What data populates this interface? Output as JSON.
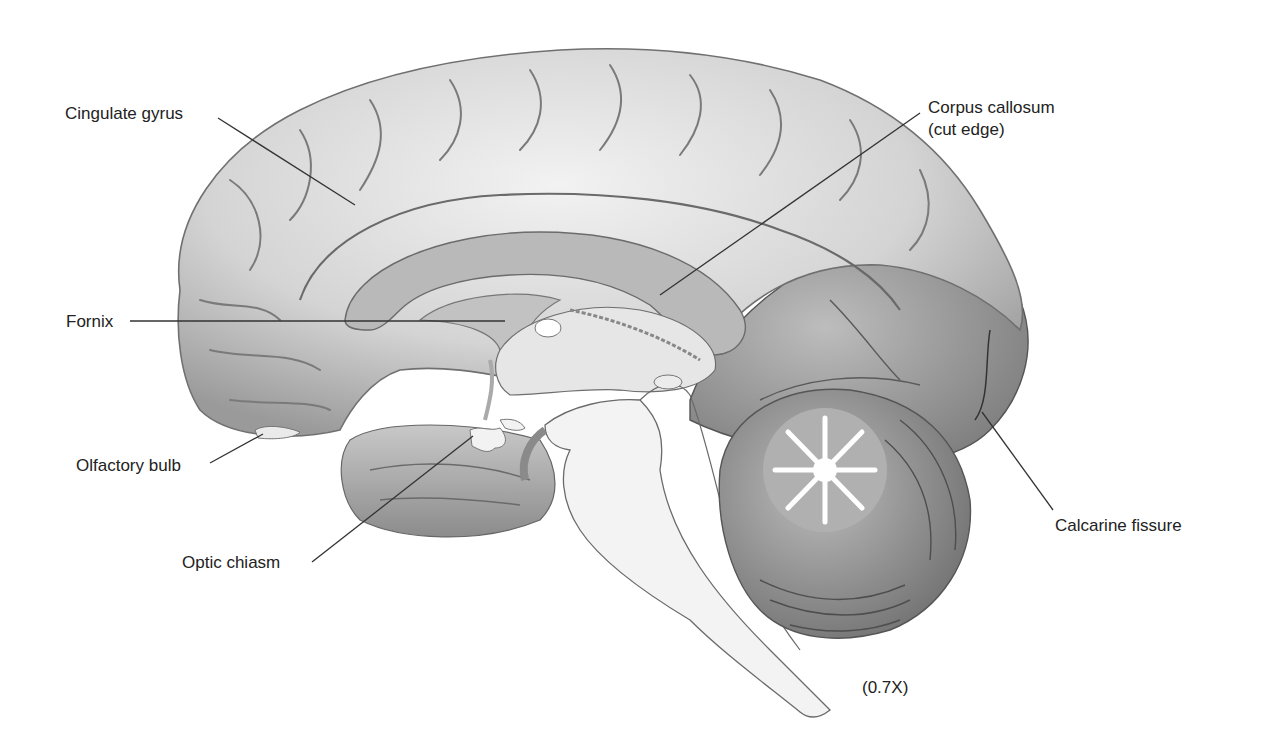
{
  "figure": {
    "magnification": "(0.7X)",
    "labels": [
      {
        "id": "cingulate-gyrus",
        "text": "Cingulate gyrus"
      },
      {
        "id": "corpus-callosum",
        "text": "Corpus callosum",
        "text2": "(cut edge)"
      },
      {
        "id": "fornix",
        "text": "Fornix"
      },
      {
        "id": "olfactory-bulb",
        "text": "Olfactory bulb"
      },
      {
        "id": "optic-chiasm",
        "text": "Optic chiasm"
      },
      {
        "id": "calcarine-fissure",
        "text": "Calcarine fissure"
      }
    ],
    "colors": {
      "background": "#ffffff",
      "cortex": "#d9d9d9",
      "cortex_shadow": "#8a8a8a",
      "cut_surface": "#b9b9b9",
      "white_matter": "#f4f4f4",
      "leader_line": "#333333",
      "label_text": "#222222"
    }
  }
}
